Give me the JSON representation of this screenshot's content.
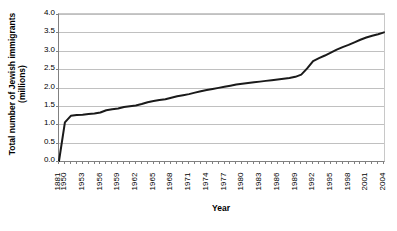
{
  "chart_data": {
    "type": "line",
    "title": "",
    "xlabel": "Year",
    "ylabel": "Total number of Jewish immigrants (millions)",
    "ylabel_line1": "Total number of Jewish immigrants",
    "ylabel_line2": "(millions)",
    "ylim": [
      0.0,
      4.0
    ],
    "ytick_labels": [
      "0.0",
      "0.5",
      "1.0",
      "1.5",
      "2.0",
      "2.5",
      "3.0",
      "3.5",
      "4.0"
    ],
    "ytick_values": [
      0.0,
      0.5,
      1.0,
      1.5,
      2.0,
      2.5,
      3.0,
      3.5,
      4.0
    ],
    "grid": true,
    "legend": "none",
    "xtick_labels": [
      "1881",
      "1950",
      "1953",
      "1956",
      "1959",
      "1962",
      "1965",
      "1968",
      "1971",
      "1974",
      "1977",
      "1980",
      "1983",
      "1986",
      "1989",
      "1992",
      "1995",
      "1998",
      "2001",
      "2004"
    ],
    "categories": [
      "1881",
      "1950",
      "1951",
      "1952",
      "1953",
      "1954",
      "1955",
      "1956",
      "1957",
      "1958",
      "1959",
      "1960",
      "1961",
      "1962",
      "1963",
      "1964",
      "1965",
      "1966",
      "1967",
      "1968",
      "1969",
      "1970",
      "1971",
      "1972",
      "1973",
      "1974",
      "1975",
      "1976",
      "1977",
      "1978",
      "1979",
      "1980",
      "1981",
      "1982",
      "1983",
      "1984",
      "1985",
      "1986",
      "1987",
      "1988",
      "1989",
      "1990",
      "1991",
      "1992",
      "1993",
      "1994",
      "1995",
      "1996",
      "1997",
      "1998",
      "1999",
      "2000",
      "2001",
      "2002",
      "2003",
      "2004"
    ],
    "values": [
      0.0,
      1.05,
      1.23,
      1.25,
      1.26,
      1.28,
      1.29,
      1.32,
      1.38,
      1.41,
      1.43,
      1.47,
      1.49,
      1.51,
      1.55,
      1.6,
      1.63,
      1.66,
      1.68,
      1.72,
      1.76,
      1.79,
      1.82,
      1.86,
      1.9,
      1.93,
      1.96,
      1.99,
      2.02,
      2.05,
      2.08,
      2.1,
      2.12,
      2.14,
      2.16,
      2.18,
      2.2,
      2.22,
      2.24,
      2.26,
      2.29,
      2.35,
      2.52,
      2.72,
      2.8,
      2.87,
      2.95,
      3.03,
      3.1,
      3.16,
      3.23,
      3.3,
      3.36,
      3.41,
      3.45,
      3.5
    ],
    "series_color": "#1a1a1a",
    "grid_color": "#c0c0c0",
    "axis_color": "#808080",
    "background": "#ffffff"
  }
}
